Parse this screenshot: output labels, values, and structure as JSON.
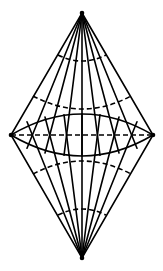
{
  "diagram": {
    "stroke_color": "#000000",
    "background_color": "#ffffff",
    "vertices": {
      "top": [
        82,
        13
      ],
      "bottom": [
        82,
        258
      ],
      "left": [
        11,
        135
      ],
      "right": [
        153,
        135
      ]
    },
    "meridian_equator_x": [
      27,
      45,
      64,
      82,
      100,
      119,
      137
    ],
    "equator": {
      "style": "dashed",
      "y": 135
    },
    "ellipse": {
      "upper_peak_y": 114,
      "lower_peak_y": 156,
      "style": "solid"
    },
    "latitude_arcs": [
      {
        "name": "upper-small",
        "x1": 58,
        "x2": 106,
        "end_y": 55,
        "mid_y": 61,
        "style": "dashed"
      },
      {
        "name": "upper-large",
        "x1": 33,
        "x2": 131,
        "end_y": 96,
        "mid_y": 109,
        "style": "dashed"
      },
      {
        "name": "lower-large",
        "x1": 33,
        "x2": 131,
        "end_y": 174,
        "mid_y": 161,
        "style": "dashed"
      },
      {
        "name": "lower-small",
        "x1": 58,
        "x2": 106,
        "end_y": 215,
        "mid_y": 209,
        "style": "dashed"
      }
    ]
  }
}
